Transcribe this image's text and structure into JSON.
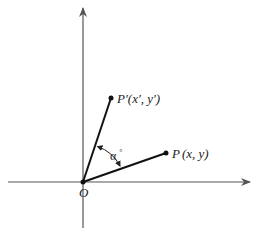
{
  "diagram": {
    "type": "rotation-of-point",
    "colors": {
      "axis": "#555555",
      "segment": "#111111",
      "text": "#222222",
      "background": "#ffffff"
    },
    "origin": {
      "label": "O",
      "x": 83,
      "y": 182
    },
    "axes": {
      "x_axis": {
        "from": [
          8,
          182
        ],
        "to": [
          250,
          182
        ],
        "arrow": "right"
      },
      "y_axis": {
        "from": [
          83,
          228
        ],
        "to": [
          83,
          8
        ],
        "arrow": "up"
      }
    },
    "points": [
      {
        "id": "P",
        "label_main": "P",
        "label_coords": "(x, y)",
        "x": 166,
        "y": 153
      },
      {
        "id": "P_prime",
        "label_main": "P′",
        "label_coords": "(x′, y′)",
        "x": 111,
        "y": 98
      }
    ],
    "angle": {
      "label": "α",
      "degree_mark": "°",
      "between": [
        "OP",
        "OP′"
      ]
    }
  }
}
